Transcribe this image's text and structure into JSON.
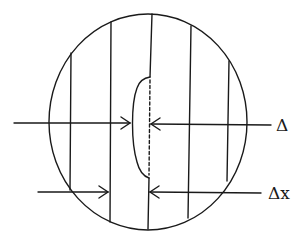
{
  "diagram": {
    "type": "schematic",
    "stroke_color": "#1a1a1a",
    "background": "#ffffff",
    "labels": {
      "displacement": "Δ",
      "fringe_spacing": "Δx"
    },
    "circle": {
      "cx": 148,
      "cy": 122,
      "rx": 99,
      "ry": 108
    },
    "fringe_lines_x": [
      71,
      111,
      152,
      191,
      229
    ],
    "annotations": [
      {
        "label": "Δ",
        "y": 123,
        "left_arrow_tip_x": 131,
        "right_arrow_tip_x": 150
      },
      {
        "label": "Δx",
        "y": 192,
        "left_arrow_tip_x": 109,
        "right_arrow_tip_x": 149
      }
    ]
  }
}
